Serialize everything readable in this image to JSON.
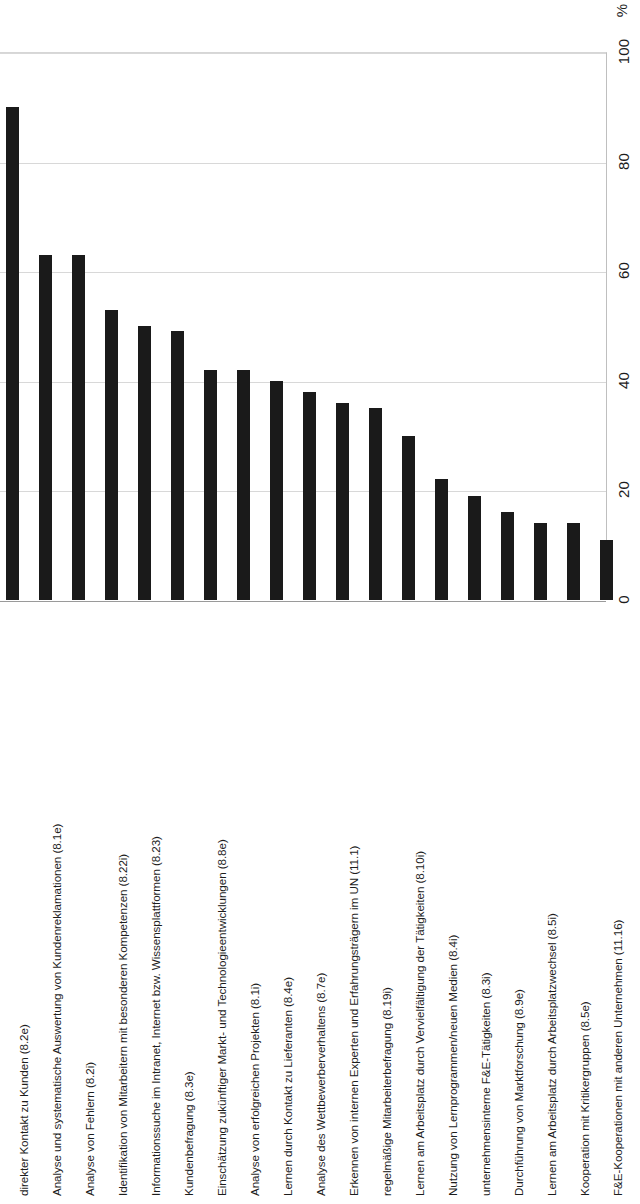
{
  "chart_data": {
    "type": "bar",
    "title": "",
    "subtitle": "",
    "xlabel": "",
    "ylabel": "",
    "unit_label": "%",
    "orientation": "vertical-bars-rotated-page",
    "grid": true,
    "legend": false,
    "ylim": [
      0,
      100
    ],
    "ytick_labels": [
      "0",
      "20",
      "40",
      "60",
      "80",
      "100"
    ],
    "yticks": [
      0,
      20,
      40,
      60,
      80,
      100
    ],
    "bar_color": "#1a1a1a",
    "gridline_color": "#d8d8d8",
    "background_color": "#ffffff",
    "categories": [
      "direkter Kontakt zu Kunden (8.2e)",
      "Analyse und systematische Auswertung von Kundenreklamationen (8.1e)",
      "Analyse von Fehlern (8.2i)",
      "Identifikation von Mitarbeitern mit besonderen Kompetenzen (8.22i)",
      "Informationssuche im Intranet, Internet bzw. Wissensplattformen (8.23)",
      "Kundenbefragung (8.3e)",
      "Einschätzung zukünftiger Markt- und Technologieentwicklungen (8.8e)",
      "Analyse von erfolgreichen Projekten (8.1i)",
      "Lernen durch Kontakt zu Lieferanten (8.4e)",
      "Analyse des Wettbewerberverhaltens (8.7e)",
      "Erkennen von internen Experten und Erfahrungsträgern im UN (11.1)",
      "regelmäßige Mitarbeiterbefragung (8.19i)",
      "Lernen am Arbeitsplatz durch Vervielfältigung der Tätigkeiten (8.10i)",
      "Nutzung von Lernprogrammen/neuen Medien (8.4i)",
      "unternehmensinterne F&E-Tätigkeiten (8.3i)",
      "Durchführung von Marktforschung (8.9e)",
      "Lernen am Arbeitsplatz durch Arbeitsplatzwechsel (8.5i)",
      "Kooperation mit Kritikergruppen (8.5e)",
      "F&E-Kooperationen mit anderen Unternehmen (11.16)"
    ],
    "values": [
      90,
      63,
      63,
      53,
      50,
      49,
      42,
      42,
      40,
      38,
      36,
      35,
      30,
      22,
      19,
      16,
      14,
      14,
      11
    ]
  }
}
